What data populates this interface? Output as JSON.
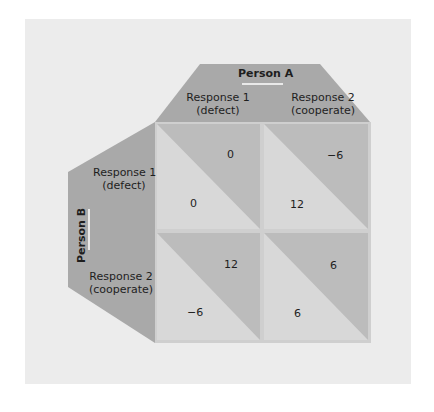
{
  "colors": {
    "background_panel": "#ececec",
    "header_panel": "#a9a9a9",
    "cell_light": "#d8d8d8",
    "cell_dark": "#bcbcbc",
    "grid_border": "#cfcfcf",
    "underline": "#ffffff"
  },
  "person_a": {
    "title": "Person A",
    "responses": [
      {
        "line1": "Response 1",
        "line2": "(defect)"
      },
      {
        "line1": "Response 2",
        "line2": "(cooperate)"
      }
    ]
  },
  "person_b": {
    "title": "Person B",
    "responses": [
      {
        "line1": "Response 1",
        "line2": "(defect)"
      },
      {
        "line1": "Response 2",
        "line2": "(cooperate)"
      }
    ]
  },
  "matrix": {
    "cells": [
      {
        "row": "Response 1 (defect)",
        "col": "Response 1 (defect)",
        "a_payoff": "0",
        "b_payoff": "0"
      },
      {
        "row": "Response 1 (defect)",
        "col": "Response 2 (cooperate)",
        "a_payoff": "−6",
        "b_payoff": "12"
      },
      {
        "row": "Response 2 (cooperate)",
        "col": "Response 1 (defect)",
        "a_payoff": "12",
        "b_payoff": "−6"
      },
      {
        "row": "Response 2 (cooperate)",
        "col": "Response 2 (cooperate)",
        "a_payoff": "6",
        "b_payoff": "6"
      }
    ]
  }
}
